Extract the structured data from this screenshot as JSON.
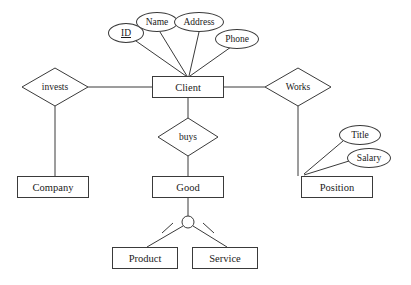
{
  "diagram": {
    "background_color": "#ffffff",
    "stroke_color": "#3a3a3a",
    "text_color": "#1a1a1a"
  },
  "entities": [
    {
      "id": "client",
      "label": "Client",
      "x": 152,
      "y": 76,
      "w": 72,
      "h": 22
    },
    {
      "id": "company",
      "label": "Company",
      "x": 17,
      "y": 176,
      "w": 72,
      "h": 22
    },
    {
      "id": "good",
      "label": "Good",
      "x": 152,
      "y": 176,
      "w": 72,
      "h": 22
    },
    {
      "id": "position",
      "label": "Position",
      "x": 301,
      "y": 176,
      "w": 72,
      "h": 22
    },
    {
      "id": "product",
      "label": "Product",
      "x": 112,
      "y": 247,
      "w": 66,
      "h": 22
    },
    {
      "id": "service",
      "label": "Service",
      "x": 192,
      "y": 247,
      "w": 66,
      "h": 22
    }
  ],
  "relationships": [
    {
      "id": "invests",
      "label": "invests",
      "cx": 55,
      "cy": 87,
      "rx": 33,
      "ry": 19
    },
    {
      "id": "works",
      "label": "Works",
      "cx": 298,
      "cy": 87,
      "rx": 33,
      "ry": 19
    },
    {
      "id": "buys",
      "label": "buys",
      "cx": 188,
      "cy": 137,
      "rx": 30,
      "ry": 19
    }
  ],
  "attributes": [
    {
      "id": "id",
      "label": "ID",
      "cx": 126,
      "cy": 33,
      "rx": 18,
      "ry": 10,
      "primary_key": true
    },
    {
      "id": "name",
      "label": "Name",
      "cx": 157,
      "cy": 22,
      "rx": 21,
      "ry": 10,
      "primary_key": false
    },
    {
      "id": "address",
      "label": "Address",
      "cx": 199,
      "cy": 22,
      "rx": 25,
      "ry": 10,
      "primary_key": false
    },
    {
      "id": "phone",
      "label": "Phone",
      "cx": 237,
      "cy": 39,
      "rx": 22,
      "ry": 10,
      "primary_key": false
    },
    {
      "id": "title",
      "label": "Title",
      "cx": 360,
      "cy": 135,
      "rx": 21,
      "ry": 10,
      "primary_key": false
    },
    {
      "id": "salary",
      "label": "Salary",
      "cx": 369,
      "cy": 158,
      "rx": 22,
      "ry": 10,
      "primary_key": false
    }
  ],
  "specialization": {
    "id": "good-isa",
    "parent": "good",
    "children": [
      "product",
      "service"
    ],
    "circle": {
      "cx": 188,
      "cy": 222,
      "r": 6
    },
    "disjoint_marks": true
  },
  "connections": [
    {
      "from": "id",
      "to": "client",
      "kind": "attribute-link"
    },
    {
      "from": "name",
      "to": "client",
      "kind": "attribute-link"
    },
    {
      "from": "address",
      "to": "client",
      "kind": "attribute-link"
    },
    {
      "from": "phone",
      "to": "client",
      "kind": "attribute-link"
    },
    {
      "from": "invests",
      "to": "client",
      "kind": "relationship-link"
    },
    {
      "from": "invests",
      "to": "company",
      "kind": "relationship-link"
    },
    {
      "from": "works",
      "to": "client",
      "kind": "relationship-link"
    },
    {
      "from": "works",
      "to": "position",
      "kind": "relationship-link"
    },
    {
      "from": "client",
      "to": "buys",
      "kind": "relationship-link"
    },
    {
      "from": "buys",
      "to": "good",
      "kind": "relationship-link"
    },
    {
      "from": "title",
      "to": "position",
      "kind": "attribute-link"
    },
    {
      "from": "salary",
      "to": "position",
      "kind": "attribute-link"
    },
    {
      "from": "good",
      "to": "good-isa",
      "kind": "isa-link"
    },
    {
      "from": "good-isa",
      "to": "product",
      "kind": "isa-link"
    },
    {
      "from": "good-isa",
      "to": "service",
      "kind": "isa-link"
    }
  ]
}
